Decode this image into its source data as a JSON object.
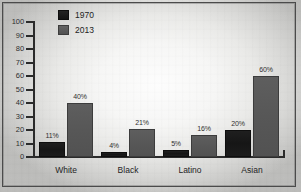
{
  "chart_data": {
    "type": "bar",
    "title": "",
    "subtitle": "",
    "xlabel": "",
    "ylabel": "",
    "categories": [
      "White",
      "Black",
      "Latino",
      "Asian"
    ],
    "series": [
      {
        "name": "1970",
        "color": "#1a1a1a",
        "values": [
          11,
          4,
          5,
          20
        ],
        "value_labels": [
          "11%",
          "4%",
          "5%",
          "20%"
        ]
      },
      {
        "name": "2013",
        "color": "#595959",
        "values": [
          40,
          21,
          16,
          60
        ],
        "value_labels": [
          "40%",
          "21%",
          "16%",
          "60%"
        ]
      }
    ],
    "ylim": [
      0,
      100
    ],
    "ytick_values": [
      0,
      10,
      20,
      30,
      40,
      50,
      60,
      70,
      80,
      90,
      100
    ],
    "ytick_labels": [
      "0",
      "10",
      "20",
      "30",
      "40",
      "50",
      "60",
      "70",
      "80",
      "90",
      "100"
    ],
    "grid": false,
    "legend_position": "top-left-inside",
    "value_label_suffix": "%"
  },
  "legend": {
    "entries": [
      {
        "label": "1970",
        "swatch": "legend-swatch-1970"
      },
      {
        "label": "2013",
        "swatch": "legend-swatch-2013"
      }
    ]
  },
  "colors": {
    "series_1970": "#1a1a1a",
    "series_2013": "#595959",
    "axis": "#2b2b2b",
    "text": "#242424",
    "paper": "#f6f6f5"
  }
}
